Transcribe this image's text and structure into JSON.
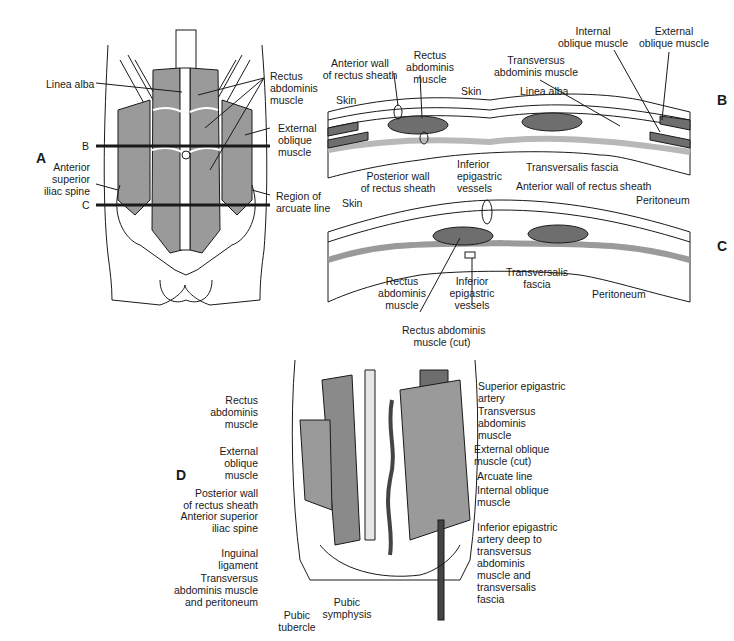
{
  "figure": {
    "panels": [
      "A",
      "B",
      "C",
      "D"
    ],
    "panel_a": {
      "section_lines": [
        "B",
        "C"
      ],
      "labels": {
        "linea_alba": "Linea alba",
        "rectus": [
          "Rectus",
          "abdominis",
          "muscle"
        ],
        "external_oblique": [
          "External",
          "oblique",
          "muscle"
        ],
        "asis": [
          "Anterior",
          "superior",
          "iliac spine"
        ],
        "arcuate": [
          "Region of",
          "arcuate line"
        ]
      }
    },
    "panel_b": {
      "labels": {
        "anterior_wall": [
          "Anterior wall",
          "of rectus sheath"
        ],
        "rectus": [
          "Rectus",
          "abdominis",
          "muscle"
        ],
        "skin_left": "Skin",
        "skin_mid": "Skin",
        "linea_alba": "Linea alba",
        "transversus": [
          "Transversus",
          "abdominis muscle"
        ],
        "internal_oblique": [
          "Internal",
          "oblique muscle"
        ],
        "external_oblique": [
          "External",
          "oblique muscle"
        ],
        "posterior_wall": [
          "Posterior wall",
          "of rectus sheath"
        ],
        "inferior_epigastric": [
          "Inferior",
          "epigastric",
          "vessels"
        ],
        "transversalis": "Transversalis fascia",
        "peritoneum": "Peritoneum"
      }
    },
    "panel_c": {
      "labels": {
        "anterior_wall": "Anterior wall of rectus sheath",
        "skin": "Skin",
        "rectus": [
          "Rectus",
          "abdominis",
          "muscle"
        ],
        "inferior_epigastric": [
          "Inferior",
          "epigastric",
          "vessels"
        ],
        "transversalis": [
          "Transversalis",
          "fascia"
        ],
        "peritoneum": "Peritoneum"
      }
    },
    "panel_d": {
      "labels": {
        "rectus_cut": [
          "Rectus abdominis",
          "muscle (cut)"
        ],
        "rectus": [
          "Rectus",
          "abdominis",
          "muscle"
        ],
        "superior_epigastric": [
          "Superior epigastric",
          "artery"
        ],
        "transversus": [
          "Transversus",
          "abdominis",
          "muscle"
        ],
        "external_oblique": [
          "External",
          "oblique",
          "muscle"
        ],
        "external_oblique_cut": [
          "External oblique",
          "muscle (cut)"
        ],
        "arcuate_line": "Arcuate line",
        "posterior_wall": [
          "Posterior wall",
          "of rectus sheath"
        ],
        "internal_oblique": [
          "Internal oblique",
          "muscle"
        ],
        "asis": [
          "Anterior superior",
          "iliac spine"
        ],
        "inferior_epigastric": [
          "Inferior epigastric",
          "artery deep to",
          "transversus",
          "abdominis",
          "muscle and",
          "transversalis",
          "fascia"
        ],
        "inguinal": [
          "Inguinal",
          "ligament"
        ],
        "transversus_peritoneum": [
          "Transversus",
          "abdominis muscle",
          "and peritoneum"
        ],
        "pubic_symphysis": [
          "Pubic",
          "symphysis"
        ],
        "pubic_tubercle": [
          "Pubic",
          "tubercle"
        ]
      }
    }
  },
  "colors": {
    "muscle": "#9a9a9a",
    "muscle_dark": "#6e6e6e",
    "line": "#1a1a1a",
    "fascia": "#b8b8b8"
  }
}
